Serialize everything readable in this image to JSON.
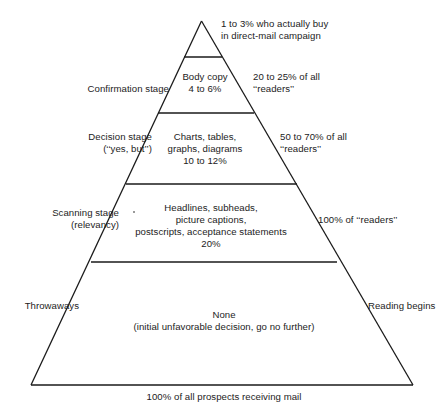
{
  "diagram": {
    "type": "pyramid",
    "base_caption": "100% of all prospects receiving mail",
    "tiers": [
      {
        "id": "apex",
        "stage_label": "",
        "content": "",
        "outside_right": "1 to 3% who actually buy\nin direct-mail campaign",
        "outside_right_lines": [
          "1 to 3% who actually buy",
          "in direct-mail campaign"
        ]
      },
      {
        "id": "confirmation",
        "stage_label": "Confirmation stage",
        "stage_label_lines": [
          "Confirmation stage"
        ],
        "content_lines": [
          "Body copy",
          "4 to 6%"
        ],
        "outside_right_lines": [
          "20 to 25% of all",
          "‘‘readers’’"
        ]
      },
      {
        "id": "decision",
        "stage_label_lines": [
          "Decision stage",
          "(‘‘yes, but’’)"
        ],
        "content_lines": [
          "Charts, tables,",
          "graphs, diagrams",
          "10 to 12%"
        ],
        "outside_right_lines": [
          "50 to 70% of all",
          "‘‘readers’’"
        ]
      },
      {
        "id": "scanning",
        "stage_label_lines": [
          "Scanning stage",
          "(relevancy)"
        ],
        "content_lines": [
          "Headlines, subheads,",
          "picture captions,",
          "postscripts, acceptance statements",
          "20%"
        ],
        "outside_right_lines": [
          "100% of ‘‘readers’’"
        ]
      },
      {
        "id": "base",
        "stage_label_lines": [
          "Throwaways"
        ],
        "content_lines": [
          "None",
          "(initial unfavorable decision, go no further)"
        ],
        "outside_right_lines": [
          "Reading begins"
        ]
      }
    ]
  },
  "labels": {
    "apex_right_line1": "1 to 3% who actually buy",
    "apex_right_line2": "in direct-mail campaign",
    "confirmation_stage": "Confirmation stage",
    "confirmation_content_line1": "Body copy",
    "confirmation_content_line2": "4 to 6%",
    "confirmation_right_line1": "20 to 25% of all",
    "confirmation_right_line2": "‘‘readers’’",
    "decision_stage_line1": "Decision stage",
    "decision_stage_line2": "(‘‘yes, but’’)",
    "decision_content_line1": "Charts, tables,",
    "decision_content_line2": "graphs, diagrams",
    "decision_content_line3": "10 to 12%",
    "decision_right_line1": "50 to 70% of all",
    "decision_right_line2": "‘‘readers’’",
    "scanning_stage_line1": "Scanning stage",
    "scanning_stage_line2": "(relevancy)",
    "scanning_content_line1": "Headlines, subheads,",
    "scanning_content_line2": "picture captions,",
    "scanning_content_line3": "postscripts, acceptance statements",
    "scanning_content_line4": "20%",
    "scanning_right_line1": "100% of ‘‘readers’’",
    "base_left": "Throwaways",
    "base_content_line1": "None",
    "base_content_line2": "(initial unfavorable decision, go no further)",
    "base_right": "Reading begins",
    "base_caption": "100% of all prospects receiving mail"
  },
  "colors": {
    "line": "#1a1a1a",
    "text": "#1c1c1c",
    "background": "#ffffff"
  }
}
